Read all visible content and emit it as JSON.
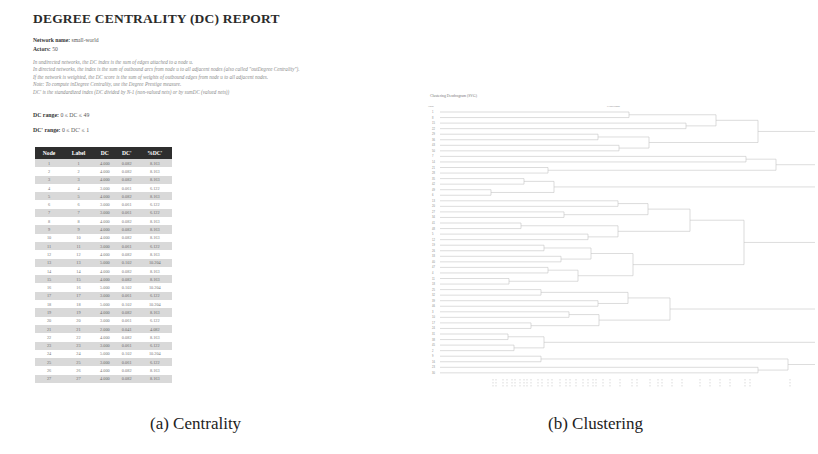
{
  "panel_a": {
    "title": "DEGREE CENTRALITY (DC) REPORT",
    "network_name_label": "Network name:",
    "network_name_value": "small-world",
    "actors_label": "Actors:",
    "actors_value": "50",
    "description": [
      "In undirected networks, the DC index is the sum of edges attached to a node u.",
      "In directed networks, the index is the sum of outbound arcs from node u to all adjacent nodes (also called \"outDegree Centrality\").",
      "If the network is weighted, the DC score is the sum of weights of outbound edges from node u to all adjacent nodes.",
      "Note: To compute inDegree Centrality, use the Degree Prestige measure.",
      "DC' is the standardized index (DC divided by N-1 (non-valued nets) or by sumDC (valued nets))"
    ],
    "dc_range_label": "DC range:",
    "dc_range_value": "0 ≤ DC ≤ 49",
    "dcp_range_label": "DC' range:",
    "dcp_range_value": "0 ≤ DC' ≤ 1",
    "table": {
      "headers": [
        "Node",
        "Label",
        "DC",
        "DC'",
        "%DC'"
      ],
      "rows": [
        [
          "1",
          "1",
          "4.000",
          "0.082",
          "8.163"
        ],
        [
          "2",
          "2",
          "4.000",
          "0.082",
          "8.163"
        ],
        [
          "3",
          "3",
          "4.000",
          "0.082",
          "8.163"
        ],
        [
          "4",
          "4",
          "3.000",
          "0.061",
          "6.122"
        ],
        [
          "5",
          "5",
          "4.000",
          "0.082",
          "8.163"
        ],
        [
          "6",
          "6",
          "3.000",
          "0.061",
          "6.122"
        ],
        [
          "7",
          "7",
          "3.000",
          "0.061",
          "6.122"
        ],
        [
          "8",
          "8",
          "4.000",
          "0.082",
          "8.163"
        ],
        [
          "9",
          "9",
          "4.000",
          "0.082",
          "8.163"
        ],
        [
          "10",
          "10",
          "4.000",
          "0.082",
          "8.163"
        ],
        [
          "11",
          "11",
          "3.000",
          "0.061",
          "6.122"
        ],
        [
          "12",
          "12",
          "4.000",
          "0.082",
          "8.163"
        ],
        [
          "13",
          "13",
          "5.000",
          "0.102",
          "10.204"
        ],
        [
          "14",
          "14",
          "4.000",
          "0.082",
          "8.163"
        ],
        [
          "15",
          "15",
          "4.000",
          "0.082",
          "8.163"
        ],
        [
          "16",
          "16",
          "5.000",
          "0.102",
          "10.204"
        ],
        [
          "17",
          "17",
          "3.000",
          "0.061",
          "6.122"
        ],
        [
          "18",
          "18",
          "5.000",
          "0.102",
          "10.204"
        ],
        [
          "19",
          "19",
          "4.000",
          "0.082",
          "8.163"
        ],
        [
          "20",
          "20",
          "3.000",
          "0.061",
          "6.122"
        ],
        [
          "21",
          "21",
          "2.000",
          "0.041",
          "4.082"
        ],
        [
          "22",
          "22",
          "4.000",
          "0.082",
          "8.163"
        ],
        [
          "23",
          "23",
          "3.000",
          "0.061",
          "6.122"
        ],
        [
          "24",
          "24",
          "5.000",
          "0.102",
          "10.204"
        ],
        [
          "25",
          "25",
          "3.000",
          "0.061",
          "6.122"
        ],
        [
          "26",
          "26",
          "4.000",
          "0.082",
          "8.163"
        ],
        [
          "27",
          "27",
          "4.000",
          "0.082",
          "8.163"
        ]
      ]
    },
    "caption": "(a) Centrality"
  },
  "panel_b": {
    "title": "Clustering Dendrogram (SVG)",
    "node_header": "Node",
    "cluster_header": "Clusterings",
    "caption": "(b) Clustering"
  }
}
